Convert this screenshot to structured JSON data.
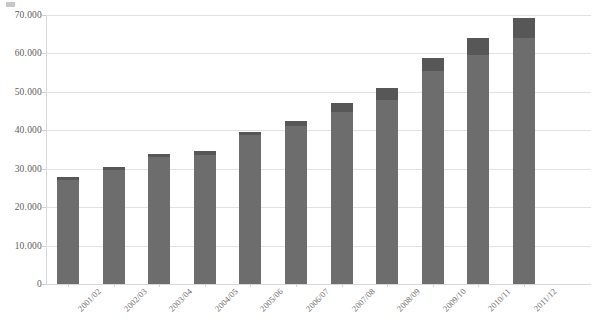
{
  "chart_data": {
    "type": "bar",
    "title": "",
    "subtitle": "",
    "xlabel": "",
    "ylabel": "",
    "stacked": true,
    "grid": true,
    "legend_position": "none",
    "ylim": [
      0,
      70000
    ],
    "yticks": [
      0,
      10000,
      20000,
      30000,
      40000,
      50000,
      60000,
      70000
    ],
    "ytick_labels": [
      "0",
      "10.000",
      "20.000",
      "30.000",
      "40.000",
      "50.000",
      "60.000",
      "70.000"
    ],
    "categories": [
      "2001/02",
      "2002/03",
      "2003/04",
      "2004/05",
      "2005/06",
      "2006/07",
      "2007/08",
      "2008/09",
      "2009/10",
      "2010/11",
      "2011/12"
    ],
    "series": [
      {
        "name": "Lower segment",
        "color": "#6d6d6d",
        "values": [
          27100,
          29700,
          33100,
          33700,
          38800,
          41000,
          44700,
          47800,
          55500,
          59700,
          64000
        ]
      },
      {
        "name": "Upper segment",
        "color": "#575757",
        "values": [
          700,
          700,
          800,
          800,
          800,
          1400,
          2300,
          3200,
          3400,
          4300,
          5200
        ]
      }
    ],
    "totals": [
      27800,
      30400,
      33900,
      34500,
      39600,
      42400,
      47000,
      51000,
      58900,
      64000,
      69200
    ]
  },
  "style": {
    "background": "#ffffff",
    "gridline_color": "#e2e2e2",
    "axis_color": "#d9d9d9",
    "text_color": "#5c5c5c",
    "bar_lower_color": "#6d6d6d",
    "bar_upper_color": "#575757"
  },
  "corner_marker": {
    "name": "legend-marker",
    "color": "#9a9a9a"
  }
}
